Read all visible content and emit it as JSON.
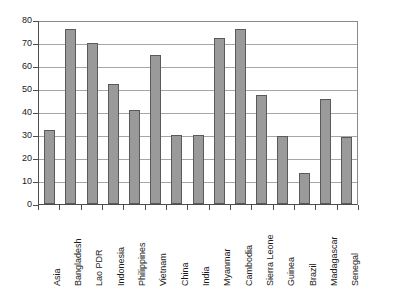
{
  "chart_data": {
    "type": "bar",
    "title": "",
    "subtitle": "",
    "xlabel": "",
    "ylabel": "",
    "ylim": [
      0,
      80
    ],
    "yticks": [
      0,
      10,
      20,
      30,
      40,
      50,
      60,
      70,
      80
    ],
    "ytick_labels": [
      "0",
      "10",
      "20",
      "30",
      "40",
      "50",
      "60",
      "70",
      "80"
    ],
    "grid": "horizontal",
    "legend": "none",
    "categories": [
      "Asia",
      "Bangladesh",
      "Lao PDR",
      "Indonesia",
      "Philippines",
      "Vietnam",
      "China",
      "India",
      "Myanmar",
      "Cambodia",
      "Sierra Leone",
      "Guinea",
      "Brazil",
      "Madagascar",
      "Senegal"
    ],
    "values": [
      32,
      76,
      70,
      52,
      41,
      65,
      30,
      30,
      72,
      76,
      47.5,
      29.5,
      13.5,
      45.5,
      29
    ],
    "series": [
      {
        "name": "",
        "values": [
          32,
          76,
          70,
          52,
          41,
          65,
          30,
          30,
          72,
          76,
          47.5,
          29.5,
          13.5,
          45.5,
          29
        ]
      }
    ],
    "colors": {
      "bar_fill": "#9a9a9a",
      "bar_stroke": "#5a5a5a",
      "gridline": "#a6a6a6",
      "axis": "#4d4d4d",
      "plot_background": "#ffffff",
      "text": "#1a1a1a"
    }
  }
}
